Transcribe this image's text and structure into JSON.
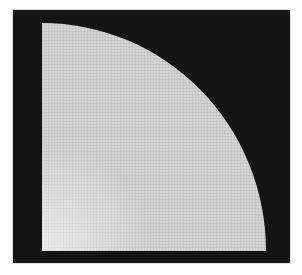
{
  "image": {
    "description": "Light gray quarter-circle mesh on a black square background",
    "colors": {
      "background": "#141414",
      "shape": "#d4d4d4",
      "page": "#ffffff"
    }
  }
}
